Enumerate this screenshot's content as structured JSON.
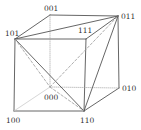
{
  "diagram": {
    "title": "",
    "type": "cube-vertex-diagram",
    "colors": {
      "edge": "#555555",
      "hidden": "#9a9a9a",
      "faint": "#cccccc",
      "label": "#333333"
    },
    "vertices": [
      {
        "id": "001",
        "label": "001",
        "x": 50,
        "y": 15,
        "lx": 44,
        "ly": 11
      },
      {
        "id": "011",
        "label": "011",
        "x": 118,
        "y": 16,
        "lx": 121,
        "ly": 19
      },
      {
        "id": "101",
        "label": "101",
        "x": 15,
        "y": 39,
        "lx": 5,
        "ly": 36
      },
      {
        "id": "111",
        "label": "111",
        "x": 86,
        "y": 39,
        "lx": 78,
        "ly": 33
      },
      {
        "id": "000",
        "label": "000",
        "x": 50,
        "y": 87,
        "lx": 44,
        "ly": 100
      },
      {
        "id": "010",
        "label": "010",
        "x": 119,
        "y": 88,
        "lx": 122,
        "ly": 91
      },
      {
        "id": "100",
        "label": "100",
        "x": 14,
        "y": 111,
        "lx": 6,
        "ly": 123
      },
      {
        "id": "110",
        "label": "110",
        "x": 84,
        "y": 111,
        "lx": 80,
        "ly": 123
      }
    ],
    "edges": [
      {
        "from": "001",
        "to": "011",
        "style": "solid"
      },
      {
        "from": "101",
        "to": "111",
        "style": "solid"
      },
      {
        "from": "001",
        "to": "101",
        "style": "solid"
      },
      {
        "from": "011",
        "to": "111",
        "style": "solid"
      },
      {
        "from": "101",
        "to": "100",
        "style": "solid"
      },
      {
        "from": "111",
        "to": "110",
        "style": "solid"
      },
      {
        "from": "100",
        "to": "110",
        "style": "solid"
      },
      {
        "from": "011",
        "to": "010",
        "style": "solid"
      },
      {
        "from": "010",
        "to": "110",
        "style": "solid"
      },
      {
        "from": "001",
        "to": "000",
        "style": "dotted"
      },
      {
        "from": "000",
        "to": "010",
        "style": "dotted"
      },
      {
        "from": "000",
        "to": "100",
        "style": "faint"
      },
      {
        "from": "101",
        "to": "011",
        "style": "solid"
      },
      {
        "from": "101",
        "to": "110",
        "style": "solid"
      },
      {
        "from": "110",
        "to": "011",
        "style": "solid"
      },
      {
        "from": "101",
        "to": "000",
        "style": "dashed"
      },
      {
        "from": "000",
        "to": "011",
        "style": "dashed"
      },
      {
        "from": "000",
        "to": "110",
        "style": "dashed"
      }
    ]
  }
}
